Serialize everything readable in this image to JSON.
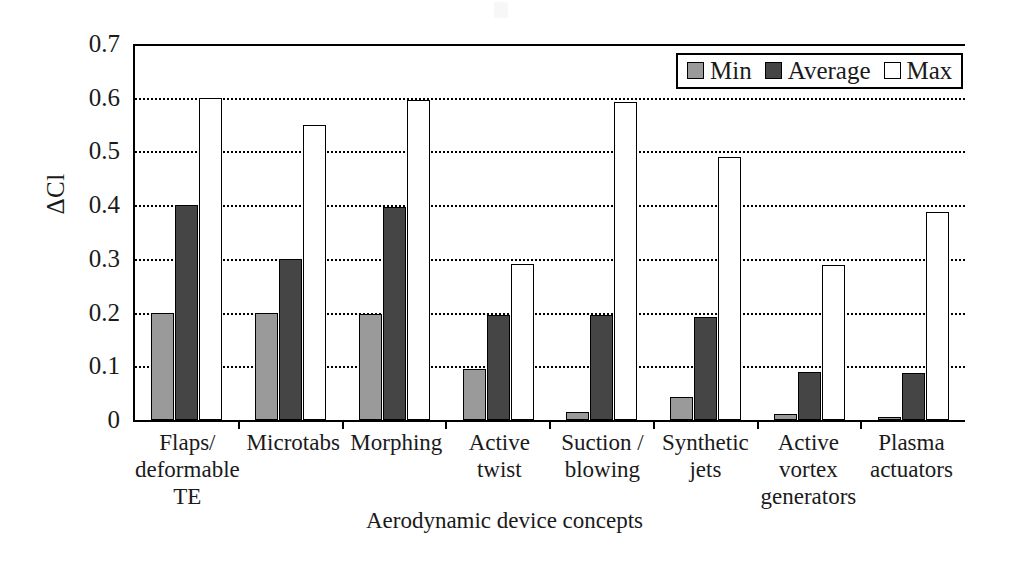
{
  "chart_data": {
    "type": "bar",
    "title": "",
    "xlabel": "Aerodynamic device concepts",
    "ylabel": "ΔCl",
    "ylim": [
      0,
      0.7
    ],
    "yticks": [
      "0.7",
      "0.6",
      "0.5",
      "0.4",
      "0.3",
      "0.2",
      "0.1",
      "0"
    ],
    "ytick_values": [
      0.7,
      0.6,
      0.5,
      0.4,
      0.3,
      0.2,
      0.1,
      0
    ],
    "grid": true,
    "legend_position": "top-right",
    "legend": [
      "Min",
      "Average",
      "Max"
    ],
    "categories": [
      "Flaps/ deformable TE",
      "Microtabs",
      "Morphing",
      "Active twist",
      "Suction / blowing",
      "Synthetic jets",
      "Active vortex generators",
      "Plasma actuators"
    ],
    "category_lines": [
      [
        "Flaps/",
        "deformable",
        "TE"
      ],
      [
        "Microtabs"
      ],
      [
        "Morphing"
      ],
      [
        "Active",
        "twist"
      ],
      [
        "Suction /",
        "blowing"
      ],
      [
        "Synthetic",
        "jets"
      ],
      [
        "Active",
        "vortex",
        "generators"
      ],
      [
        "Plasma",
        "actuators"
      ]
    ],
    "series": [
      {
        "name": "Min",
        "color": "#9a9a9a",
        "values": [
          0.2,
          0.2,
          0.198,
          0.095,
          0.015,
          0.042,
          0.012,
          0.005
        ]
      },
      {
        "name": "Average",
        "color": "#454545",
        "values": [
          0.4,
          0.299,
          0.397,
          0.196,
          0.195,
          0.192,
          0.09,
          0.088
        ]
      },
      {
        "name": "Max",
        "color": "#ffffff",
        "values": [
          0.6,
          0.549,
          0.595,
          0.291,
          0.592,
          0.49,
          0.288,
          0.388
        ]
      }
    ]
  },
  "legend": {
    "items": [
      {
        "label": "Min",
        "swatch": "min"
      },
      {
        "label": "Average",
        "swatch": "avg"
      },
      {
        "label": "Max",
        "swatch": "max"
      }
    ]
  },
  "axes": {
    "y_label": "ΔCl",
    "x_label": "Aerodynamic device concepts"
  }
}
